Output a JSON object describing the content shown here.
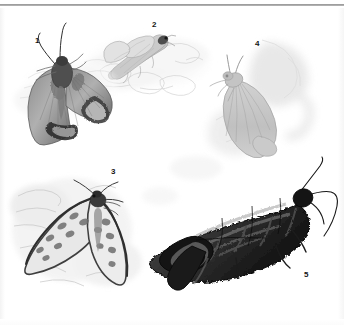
{
  "plate": {
    "kind": "scientific-illustration-plate",
    "medium": "graphite-pencil-drawing",
    "subject": "moths",
    "background_color": "#ffffff",
    "width": 344,
    "height": 325,
    "has_top_rule": true,
    "top_rule_color": "#8a8a8a"
  },
  "figures": [
    {
      "number": "1",
      "label_x": 35,
      "label_y": 36,
      "description": "dark-patterned moth with spread wings and long antennae, upper left",
      "tone": "dark",
      "accent_color": "#4a4a4a"
    },
    {
      "number": "2",
      "label_x": 152,
      "label_y": 20,
      "description": "pale faded moth at rest on a textured surface, upper middle",
      "tone": "light",
      "accent_color": "#b9b9b9"
    },
    {
      "number": "3",
      "label_x": 111,
      "label_y": 167,
      "description": "moth with dark wing margins and light spotted wing patches, lower left",
      "tone": "mid-dark",
      "accent_color": "#595959"
    },
    {
      "number": "4",
      "label_x": 255,
      "label_y": 39,
      "description": "pale grey moth with folded wings over a soft wash background, upper right",
      "tone": "pale",
      "accent_color": "#c2c2c2"
    },
    {
      "number": "5",
      "label_x": 304,
      "label_y": 270,
      "description": "very dark elongated mottled moth with long curved antennae, lower right",
      "tone": "very-dark",
      "accent_color": "#1f1f1f"
    }
  ]
}
